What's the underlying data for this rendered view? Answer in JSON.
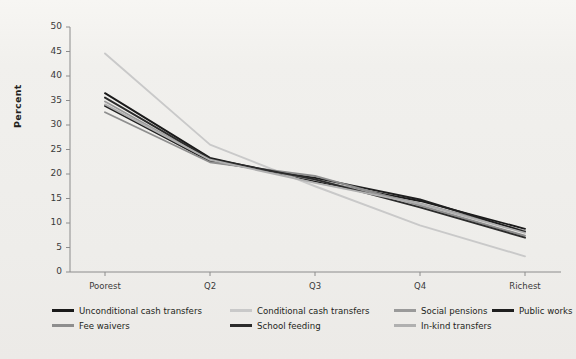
{
  "chart": {
    "type": "line",
    "title": "",
    "xlabel": "",
    "ylabel": "Percent",
    "background_color": "#f1f0ed"
  },
  "axes": {
    "y_ticks": [
      "0",
      "5",
      "10",
      "15",
      "20",
      "25",
      "30",
      "35",
      "40",
      "45",
      "50"
    ],
    "y_min": 0,
    "y_max": 50,
    "y_step": 5,
    "x_ticks": [
      "Poorest",
      "Q2",
      "Q3",
      "Q4",
      "Richest"
    ],
    "grid": "off",
    "axis_color": "#8c8c8c"
  },
  "legend": {
    "position": "bottom",
    "rows": [
      [
        {
          "label": "Unconditional cash transfers",
          "color": "#1a1a1a",
          "weight": "thick",
          "x": 0
        },
        {
          "label": "Conditional cash transfers",
          "color": "#c9c9c9",
          "weight": "thin",
          "x": 178
        },
        {
          "label": "Social pensions",
          "color": "#9a9a9a",
          "weight": "thin",
          "x": 342
        },
        {
          "label": "Public works",
          "color": "#1f1f1f",
          "weight": "thick",
          "x": 440
        }
      ],
      [
        {
          "label": "Fee waivers",
          "color": "#8e8e8e",
          "weight": "thin",
          "x": 0
        },
        {
          "label": "School feeding",
          "color": "#2b2b2b",
          "weight": "thick",
          "x": 178
        },
        {
          "label": "In-kind transfers",
          "color": "#b0b0b0",
          "weight": "thin",
          "x": 342
        }
      ]
    ]
  },
  "chart_data": {
    "type": "line",
    "title": "",
    "xlabel": "",
    "ylabel": "Percent",
    "ylim": [
      0,
      50
    ],
    "grid": "off",
    "legend_position": "bottom",
    "categories": [
      "Poorest",
      "Q2",
      "Q3",
      "Q4",
      "Richest"
    ],
    "series": [
      {
        "name": "Unconditional cash transfers",
        "color": "#1a1a1a",
        "values": [
          36.5,
          23.3,
          18.5,
          14.5,
          8.8
        ]
      },
      {
        "name": "Conditional cash transfers",
        "color": "#c9c9c9",
        "values": [
          44.6,
          26.0,
          17.5,
          9.5,
          3.2
        ]
      },
      {
        "name": "Social pensions",
        "color": "#9a9a9a",
        "values": [
          34.8,
          22.8,
          18.8,
          14.0,
          8.4
        ]
      },
      {
        "name": "Public works",
        "color": "#1f1f1f",
        "values": [
          33.9,
          22.6,
          19.2,
          14.8,
          8.2
        ]
      },
      {
        "name": "Fee waivers",
        "color": "#8e8e8e",
        "values": [
          32.6,
          22.4,
          19.6,
          13.6,
          7.4
        ]
      },
      {
        "name": "School feeding",
        "color": "#2b2b2b",
        "values": [
          35.6,
          23.1,
          18.9,
          13.2,
          7.0
        ]
      },
      {
        "name": "In-kind transfers",
        "color": "#b0b0b0",
        "values": [
          34.2,
          22.9,
          18.2,
          13.9,
          8.0
        ]
      }
    ]
  }
}
